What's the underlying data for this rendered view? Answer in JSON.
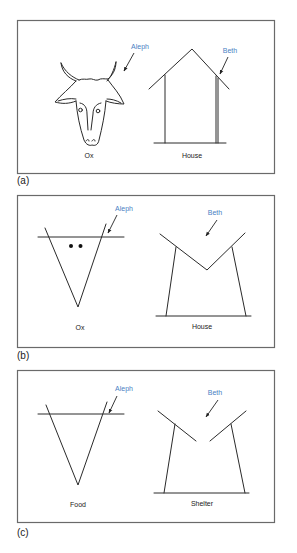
{
  "figure": {
    "panels": [
      {
        "id": "a",
        "panel_label": "(a)",
        "left": {
          "caption": "Ox",
          "annotation": "Aleph",
          "drawing": "ox-head-pictograph"
        },
        "right": {
          "caption": "House",
          "annotation": "Beth",
          "drawing": "house-pictograph"
        }
      },
      {
        "id": "b",
        "panel_label": "(b)",
        "left": {
          "caption": "Ox",
          "annotation": "Aleph",
          "drawing": "ox-v-glyph"
        },
        "right": {
          "caption": "House",
          "annotation": "Beth",
          "drawing": "house-m-glyph"
        }
      },
      {
        "id": "c",
        "panel_label": "(c)",
        "left": {
          "caption": "Food",
          "annotation": "Aleph",
          "drawing": "food-v-glyph"
        },
        "right": {
          "caption": "Shelter",
          "annotation": "Beth",
          "drawing": "shelter-glyph"
        }
      }
    ],
    "colors": {
      "annotation": "#4a7fc4",
      "stroke": "#2a2a2a",
      "frame": "#6a6a6a"
    }
  }
}
